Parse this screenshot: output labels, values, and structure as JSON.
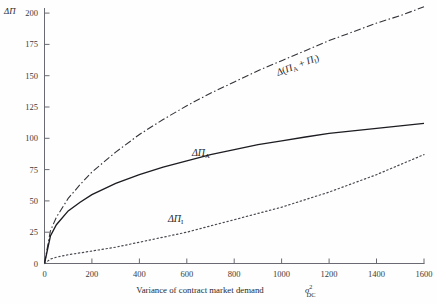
{
  "chart_data": {
    "type": "line",
    "title": "",
    "ylabel": "ΔΠ",
    "xlabel": "Variance of contract market demand σ²DC",
    "xlabel_parts": {
      "text": "Variance of contract market demand",
      "symbol_base": "σ",
      "symbol_sup": "2",
      "symbol_sub": "DC"
    },
    "xlim": [
      0,
      1600
    ],
    "ylim": [
      0,
      200
    ],
    "xticks": [
      0,
      200,
      400,
      600,
      800,
      1000,
      1200,
      1400,
      1600
    ],
    "yticks": [
      0,
      25,
      50,
      75,
      100,
      125,
      150,
      175,
      200
    ],
    "grid": false,
    "legend": "inline-curve-labels",
    "x": [
      0,
      25,
      50,
      100,
      150,
      200,
      300,
      400,
      500,
      600,
      700,
      800,
      900,
      1000,
      1100,
      1200,
      1300,
      1400,
      1500,
      1600
    ],
    "series": [
      {
        "name": "Δ(ΠA + ΠI)",
        "label": "Δ(Π_A + Π_I)",
        "style": "dash-dot",
        "color": "#33333a",
        "values": [
          0,
          26,
          37,
          52,
          63,
          73,
          89,
          103,
          115,
          126,
          136,
          145,
          154,
          162,
          170,
          178,
          185,
          192,
          198,
          205
        ]
      },
      {
        "name": "ΔΠA",
        "label": "ΔΠ_A",
        "style": "solid",
        "color": "#1c1c22",
        "values": [
          0,
          22,
          31,
          42,
          49,
          55,
          64,
          71,
          77,
          82,
          87,
          91,
          95,
          98,
          101,
          104,
          106,
          108,
          110,
          112
        ]
      },
      {
        "name": "ΔΠI",
        "label": "ΔΠ_I",
        "style": "dotted",
        "color": "#4a4a52",
        "values": [
          0,
          3.5,
          5,
          7,
          8.5,
          10,
          13,
          17,
          21,
          25,
          30,
          35,
          40,
          45,
          51,
          57,
          64,
          71,
          79,
          87
        ]
      }
    ],
    "curve_labels": [
      {
        "id": "total",
        "text": "Δ(Π",
        "sub1": "A",
        "plus": " + Π",
        "sub2": "I",
        "close": ")"
      },
      {
        "id": "agent",
        "text": "ΔΠ",
        "sub1": "A"
      },
      {
        "id": "investor",
        "text": "ΔΠ",
        "sub1": "I"
      }
    ],
    "axis_color": "#5a5a62",
    "background": "#fefefe"
  }
}
